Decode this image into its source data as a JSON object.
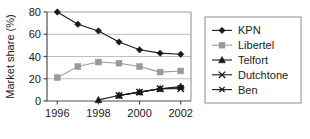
{
  "chart_data": {
    "type": "line",
    "title": "",
    "xlabel": "",
    "ylabel": "Market share (%)",
    "x": [
      1996,
      1997,
      1998,
      1999,
      2000,
      2001,
      2002
    ],
    "xtick_labels": [
      "1996",
      "1998",
      "2000",
      "2002"
    ],
    "xticks": [
      1996,
      1998,
      2000,
      2002
    ],
    "xlim": [
      1995.5,
      2002.5
    ],
    "ytick_labels": [
      "0",
      "20",
      "40",
      "60",
      "80"
    ],
    "yticks": [
      0,
      20,
      40,
      60,
      80
    ],
    "ylim": [
      0,
      80
    ],
    "grid": "horizontal",
    "legend_position": "right",
    "series": [
      {
        "name": "KPN",
        "marker": "diamond",
        "color": "#1a1a1a",
        "values": [
          80,
          69,
          63,
          53,
          46,
          43,
          42
        ]
      },
      {
        "name": "Libertel",
        "marker": "square",
        "color": "#9a9a9a",
        "values": [
          21,
          31,
          35,
          34,
          31,
          26,
          27
        ]
      },
      {
        "name": "Telfort",
        "marker": "triangle",
        "color": "#1a1a1a",
        "values": [
          null,
          null,
          1,
          5,
          8,
          11,
          13
        ]
      },
      {
        "name": "Dutchtone",
        "marker": "cross",
        "color": "#1a1a1a",
        "values": [
          null,
          null,
          null,
          5,
          8,
          11,
          11
        ]
      },
      {
        "name": "Ben",
        "marker": "asterisk",
        "color": "#1a1a1a",
        "values": [
          null,
          null,
          null,
          5,
          8,
          11,
          12
        ]
      }
    ]
  },
  "legend": {
    "items": [
      {
        "label": "KPN"
      },
      {
        "label": "Libertel"
      },
      {
        "label": "Telfort"
      },
      {
        "label": "Dutchtone"
      },
      {
        "label": "Ben"
      }
    ]
  },
  "colors": {
    "axis": "#4d4d4d",
    "grid": "#bfbfbf",
    "text": "#1a1a1a",
    "frame": "#8c8c8c",
    "background": "#ffffff"
  }
}
